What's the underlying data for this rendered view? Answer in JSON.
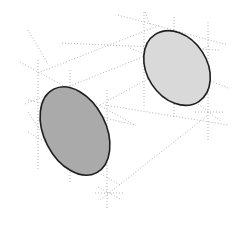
{
  "diagram": {
    "colors": {
      "background": "#ffffff",
      "guide_line": "#b4b4b4",
      "outline": "#1e1e1e",
      "front_disk_fill": "#aaaaaa",
      "back_disk_fill": "#d9d9d9"
    },
    "disks": [
      {
        "id": "front",
        "cx": 75,
        "cy": 131,
        "rx": 31,
        "ry": 47,
        "rotate": -27,
        "fill": "#aaaaaa"
      },
      {
        "id": "back",
        "cx": 177,
        "cy": 68,
        "rx": 30,
        "ry": 40,
        "rotate": -33,
        "fill": "#d9d9d9"
      }
    ],
    "guides": [
      [
        20,
        62,
        135,
        125
      ],
      [
        38,
        73,
        160,
        25
      ],
      [
        62,
        43,
        220,
        50
      ],
      [
        118,
        15,
        228,
        45
      ],
      [
        145,
        12,
        150,
        25
      ],
      [
        28,
        100,
        135,
        125
      ],
      [
        28,
        132,
        120,
        185
      ],
      [
        100,
        200,
        208,
        115
      ],
      [
        105,
        105,
        228,
        125
      ],
      [
        130,
        48,
        228,
        88
      ],
      [
        100,
        105,
        210,
        45
      ],
      [
        25,
        104,
        160,
        50
      ],
      [
        38,
        60,
        38,
        170
      ],
      [
        70,
        70,
        70,
        183
      ],
      [
        107,
        90,
        107,
        210
      ],
      [
        144,
        12,
        144,
        108
      ],
      [
        174,
        17,
        174,
        118
      ],
      [
        208,
        22,
        208,
        140
      ],
      [
        95,
        193,
        125,
        193
      ],
      [
        195,
        112,
        225,
        112
      ],
      [
        28,
        112,
        52,
        148
      ],
      [
        98,
        187,
        122,
        200
      ],
      [
        198,
        104,
        222,
        122
      ],
      [
        28,
        30,
        48,
        64
      ]
    ]
  }
}
